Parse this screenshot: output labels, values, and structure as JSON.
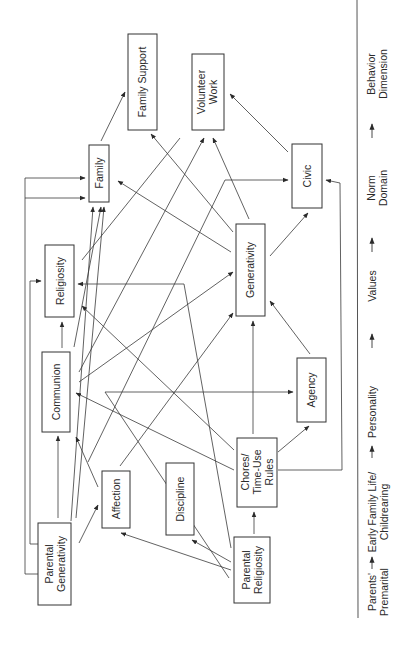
{
  "nodes": {
    "family_support": {
      "line1": "Family Support",
      "line2": ""
    },
    "volunteer_work": {
      "line1": "Volunteer",
      "line2": "Work"
    },
    "family": {
      "line1": "Family",
      "line2": ""
    },
    "civic": {
      "line1": "Civic",
      "line2": ""
    },
    "religiosity": {
      "line1": "Religiosity",
      "line2": ""
    },
    "generativity": {
      "line1": "Generativity",
      "line2": ""
    },
    "communion": {
      "line1": "Communion",
      "line2": ""
    },
    "agency": {
      "line1": "Agency",
      "line2": ""
    },
    "affection": {
      "line1": "Affection",
      "line2": ""
    },
    "discipline": {
      "line1": "Discipline",
      "line2": ""
    },
    "chores": {
      "line1": "Chores/",
      "line2": "Time-Use",
      "line3": "Rules"
    },
    "parental_generativity": {
      "line1": "Parental",
      "line2": "Generativity"
    },
    "parental_religiosity": {
      "line1": "Parental",
      "line2": "Religiosity"
    }
  },
  "legend": {
    "stages": [
      {
        "line1": "Parents'",
        "line2": "Premarital"
      },
      {
        "line1": "Early Family Life/",
        "line2": "Childrearing"
      },
      {
        "line1": "Personality",
        "line2": ""
      },
      {
        "line1": "Values",
        "line2": ""
      },
      {
        "line1": "Norm",
        "line2": "Domain"
      },
      {
        "line1": "Behavior",
        "line2": "Dimension"
      }
    ]
  },
  "edges": [
    {
      "from": "Parental Generativity",
      "to": "Communion"
    },
    {
      "from": "Parental Generativity",
      "to": "Affection"
    },
    {
      "from": "Parental Generativity",
      "to": "Family"
    },
    {
      "from": "Parental Generativity",
      "to": "Religiosity"
    },
    {
      "from": "Parental Religiosity",
      "to": "Affection"
    },
    {
      "from": "Parental Religiosity",
      "to": "Discipline"
    },
    {
      "from": "Parental Religiosity",
      "to": "Chores/Time-Use Rules"
    },
    {
      "from": "Parental Religiosity",
      "to": "Religiosity"
    },
    {
      "from": "Affection",
      "to": "Communion"
    },
    {
      "from": "Affection",
      "to": "Generativity"
    },
    {
      "from": "Chores/Time-Use Rules",
      "to": "Communion"
    },
    {
      "from": "Chores/Time-Use Rules",
      "to": "Agency"
    },
    {
      "from": "Chores/Time-Use Rules",
      "to": "Generativity"
    },
    {
      "from": "Chores/Time-Use Rules",
      "to": "Religiosity"
    },
    {
      "from": "Chores/Time-Use Rules",
      "to": "Volunteer Work"
    },
    {
      "from": "Chores/Time-Use Rules",
      "to": "Civic"
    },
    {
      "from": "Communion",
      "to": "Religiosity"
    },
    {
      "from": "Communion",
      "to": "Generativity"
    },
    {
      "from": "Communion",
      "to": "Volunteer Work"
    },
    {
      "from": "Communion",
      "to": "Agency"
    },
    {
      "from": "Communion",
      "to": "Family"
    },
    {
      "from": "Agency",
      "to": "Generativity"
    },
    {
      "from": "Generativity",
      "to": "Civic"
    },
    {
      "from": "Generativity",
      "to": "Family"
    },
    {
      "from": "Generativity",
      "to": "Family Support"
    },
    {
      "from": "Religiosity",
      "to": "Civic"
    },
    {
      "from": "Family",
      "to": "Family Support"
    },
    {
      "from": "Civic",
      "to": "Volunteer Work"
    }
  ]
}
